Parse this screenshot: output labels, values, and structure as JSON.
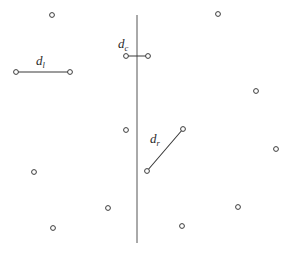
{
  "figure": {
    "width": 287,
    "height": 254,
    "background_color": "#ffffff",
    "stroke_color": "#3a3a3a",
    "divider_color": "#555555",
    "point_fill": "#ffffff",
    "label_color": "#2a2a2a"
  },
  "divider": {
    "name": "vertical-dividing-line",
    "x": 137,
    "y_top": 15,
    "y_bottom": 243,
    "stroke_width": 1
  },
  "labels": [
    {
      "id": "d_l",
      "base": "d",
      "subscript": "l",
      "x": 36,
      "y": 54
    },
    {
      "id": "d_c",
      "base": "d",
      "subscript": "c",
      "x": 118,
      "y": 37
    },
    {
      "id": "d_r",
      "base": "d",
      "subscript": "r",
      "x": 150,
      "y": 132
    }
  ],
  "segments": [
    {
      "id": "d_l",
      "name": "segment-dl",
      "x1": 16,
      "y1": 72,
      "x2": 70,
      "y2": 72,
      "stroke_width": 1.1
    },
    {
      "id": "d_c",
      "name": "segment-dc",
      "x1": 126,
      "y1": 56,
      "x2": 148,
      "y2": 56,
      "stroke_width": 1.1
    },
    {
      "id": "d_r",
      "name": "segment-dr",
      "x1": 147,
      "y1": 171,
      "x2": 183,
      "y2": 129,
      "stroke_width": 1.1
    }
  ],
  "segment_endpoints": [
    {
      "cx": 16,
      "cy": 72,
      "r": 2.4
    },
    {
      "cx": 70,
      "cy": 72,
      "r": 2.4
    },
    {
      "cx": 126,
      "cy": 56,
      "r": 2.4
    },
    {
      "cx": 148,
      "cy": 56,
      "r": 2.4
    },
    {
      "cx": 147,
      "cy": 171,
      "r": 2.4
    },
    {
      "cx": 183,
      "cy": 129,
      "r": 2.4
    }
  ],
  "scatter_points": [
    {
      "cx": 52,
      "cy": 15,
      "r": 2.4
    },
    {
      "cx": 218,
      "cy": 14,
      "r": 2.4
    },
    {
      "cx": 256,
      "cy": 91,
      "r": 2.4
    },
    {
      "cx": 126,
      "cy": 130,
      "r": 2.4
    },
    {
      "cx": 276,
      "cy": 149,
      "r": 2.4
    },
    {
      "cx": 34,
      "cy": 172,
      "r": 2.4
    },
    {
      "cx": 108,
      "cy": 208,
      "r": 2.4
    },
    {
      "cx": 238,
      "cy": 207,
      "r": 2.4
    },
    {
      "cx": 53,
      "cy": 228,
      "r": 2.4
    },
    {
      "cx": 182,
      "cy": 226,
      "r": 2.4
    }
  ]
}
